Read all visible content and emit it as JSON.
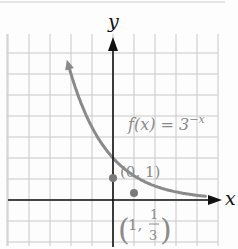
{
  "chart_data": {
    "type": "line",
    "title": "",
    "function_label": "f(x) = 3^-x",
    "function_label_main": "f(x) = 3",
    "function_label_exp": "−x",
    "xlabel": "x",
    "ylabel": "y",
    "grid": true,
    "grid_unit": 0.5,
    "xlim": [
      -3.5,
      2.5
    ],
    "ylim": [
      -1,
      4
    ],
    "series": [
      {
        "name": "f(x) = 3^-x",
        "color": "#8a8a8a",
        "x": [
          -1.5,
          -1.25,
          -1,
          -0.75,
          -0.5,
          -0.25,
          0,
          0.25,
          0.5,
          1,
          1.5,
          2
        ],
        "values": [
          5.196,
          3.948,
          3,
          2.28,
          1.732,
          1.316,
          1,
          0.76,
          0.577,
          0.333,
          0.192,
          0.111
        ]
      }
    ],
    "annotations": [
      {
        "label": "(0, 1)",
        "x": 0,
        "y": 1
      },
      {
        "label": "(1, 1/3)",
        "x": 1,
        "y": 0.3333
      }
    ]
  },
  "labels": {
    "x_axis": "x",
    "y_axis": "y",
    "func_main": "f(x) = 3",
    "func_exp": "−x",
    "point1": "(0, 1)",
    "point2_open": "(",
    "point2_x": "1,",
    "point2_num": "1",
    "point2_den": "3",
    "point2_close": ")"
  },
  "colors": {
    "grid": "#c8c8c8",
    "axis": "#111111",
    "curve": "#8a8a8a",
    "label_gray": "#8a8a8a"
  }
}
